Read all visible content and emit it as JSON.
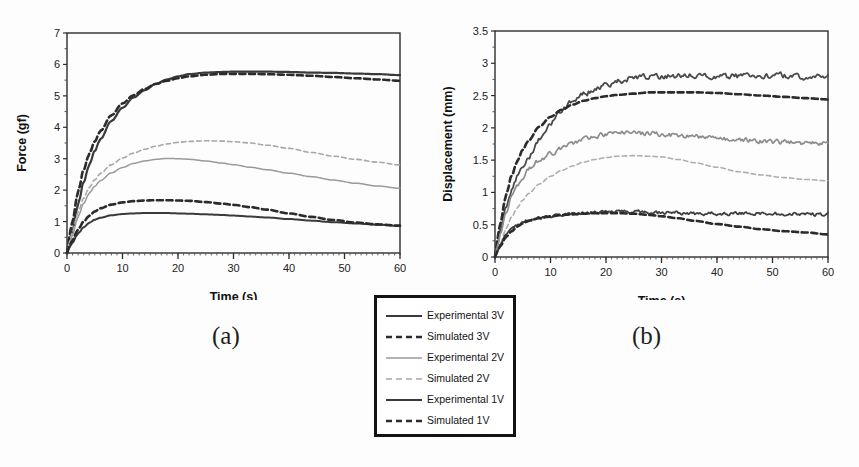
{
  "figure": {
    "panel_a_caption": "(a)",
    "panel_b_caption": "(b)"
  },
  "legend": {
    "items": [
      {
        "label": "Experimental 3V",
        "style": "solid",
        "color": "#3a3a3a",
        "width": 2.2
      },
      {
        "label": "Simulated 3V",
        "style": "dashed",
        "color": "#2b2b2b",
        "width": 2.6
      },
      {
        "label": "Experimental 2V",
        "style": "solid",
        "color": "#9a9a9a",
        "width": 1.5
      },
      {
        "label": "Simulated 2V",
        "style": "dashed",
        "color": "#a8a8a8",
        "width": 1.6
      },
      {
        "label": "Experimental 1V",
        "style": "solid",
        "color": "#3a3a3a",
        "width": 2.0
      },
      {
        "label": "Simulated 1V",
        "style": "dashed",
        "color": "#2b2b2b",
        "width": 2.6
      }
    ]
  },
  "chart_data": [
    {
      "id": "panel-a",
      "type": "line",
      "title": "",
      "xlabel": "Time (s)",
      "ylabel": "Force (gf)",
      "xlim": [
        0,
        60
      ],
      "ylim": [
        0,
        7
      ],
      "xticks": [
        0,
        10,
        20,
        30,
        40,
        50,
        60
      ],
      "yticks": [
        0,
        1,
        2,
        3,
        4,
        5,
        6,
        7
      ],
      "xticklabels": [
        "0",
        "10",
        "20",
        "30",
        "40",
        "50",
        "60"
      ],
      "yticklabels": [
        "0",
        "1",
        "2",
        "3",
        "4",
        "5",
        "6",
        "7"
      ],
      "x_minor_tick_step": 1,
      "grid": false,
      "legend_position": "external-below-center",
      "series": [
        {
          "name": "Experimental 3V",
          "style": "solid",
          "color": "#3a3a3a",
          "width": 2.2,
          "x": [
            0,
            0.5,
            1,
            2,
            3,
            4,
            5,
            6,
            8,
            10,
            12,
            14,
            16,
            18,
            20,
            22,
            25,
            28,
            30,
            33,
            36,
            40,
            44,
            48,
            52,
            56,
            60
          ],
          "y": [
            0,
            0.35,
            0.75,
            1.55,
            2.25,
            2.8,
            3.25,
            3.62,
            4.2,
            4.62,
            4.95,
            5.18,
            5.38,
            5.52,
            5.62,
            5.69,
            5.74,
            5.76,
            5.77,
            5.77,
            5.77,
            5.76,
            5.74,
            5.73,
            5.71,
            5.69,
            5.66
          ]
        },
        {
          "name": "Simulated 3V",
          "style": "dashed",
          "color": "#2b2b2b",
          "width": 2.6,
          "x": [
            0,
            0.5,
            1,
            2,
            3,
            4,
            5,
            6,
            8,
            10,
            12,
            14,
            16,
            18,
            20,
            22,
            25,
            28,
            30,
            33,
            36,
            40,
            44,
            48,
            52,
            56,
            60
          ],
          "y": [
            0,
            0.55,
            1.05,
            1.95,
            2.65,
            3.15,
            3.55,
            3.88,
            4.38,
            4.76,
            5.02,
            5.22,
            5.38,
            5.48,
            5.56,
            5.62,
            5.67,
            5.7,
            5.7,
            5.7,
            5.69,
            5.67,
            5.64,
            5.6,
            5.56,
            5.52,
            5.48
          ]
        },
        {
          "name": "Experimental 2V",
          "style": "solid",
          "color": "#9a9a9a",
          "width": 1.5,
          "x": [
            0,
            0.5,
            1,
            2,
            3,
            4,
            5,
            6,
            8,
            10,
            12,
            14,
            16,
            18,
            20,
            22,
            25,
            28,
            30,
            33,
            36,
            40,
            44,
            48,
            52,
            56,
            60
          ],
          "y": [
            0,
            0.3,
            0.6,
            1.15,
            1.58,
            1.9,
            2.12,
            2.3,
            2.55,
            2.72,
            2.85,
            2.93,
            2.98,
            3.01,
            3.0,
            2.98,
            2.93,
            2.86,
            2.81,
            2.73,
            2.65,
            2.54,
            2.43,
            2.32,
            2.22,
            2.13,
            2.06
          ]
        },
        {
          "name": "Simulated 2V",
          "style": "dashed",
          "color": "#a8a8a8",
          "width": 1.6,
          "x": [
            0,
            0.5,
            1,
            2,
            3,
            4,
            5,
            6,
            8,
            10,
            12,
            14,
            16,
            18,
            20,
            22,
            25,
            28,
            30,
            33,
            36,
            40,
            44,
            48,
            52,
            56,
            60
          ],
          "y": [
            0,
            0.35,
            0.7,
            1.3,
            1.75,
            2.08,
            2.33,
            2.53,
            2.81,
            3.02,
            3.18,
            3.3,
            3.4,
            3.47,
            3.52,
            3.55,
            3.57,
            3.56,
            3.54,
            3.5,
            3.43,
            3.33,
            3.2,
            3.08,
            2.98,
            2.89,
            2.8
          ]
        },
        {
          "name": "Experimental 1V",
          "style": "solid",
          "color": "#3a3a3a",
          "width": 2.0,
          "x": [
            0,
            0.5,
            1,
            2,
            3,
            4,
            5,
            6,
            8,
            10,
            12,
            14,
            16,
            18,
            20,
            22,
            25,
            28,
            30,
            33,
            36,
            40,
            44,
            48,
            52,
            56,
            60
          ],
          "y": [
            0,
            0.18,
            0.34,
            0.62,
            0.82,
            0.96,
            1.06,
            1.12,
            1.2,
            1.24,
            1.26,
            1.27,
            1.27,
            1.27,
            1.26,
            1.25,
            1.23,
            1.21,
            1.19,
            1.16,
            1.13,
            1.08,
            1.03,
            0.98,
            0.94,
            0.9,
            0.86
          ]
        },
        {
          "name": "Simulated 1V",
          "style": "dashed",
          "color": "#2b2b2b",
          "width": 2.6,
          "x": [
            0,
            0.5,
            1,
            2,
            3,
            4,
            5,
            6,
            8,
            10,
            12,
            14,
            16,
            18,
            20,
            22,
            25,
            28,
            30,
            33,
            36,
            40,
            44,
            48,
            52,
            56,
            60
          ],
          "y": [
            0,
            0.22,
            0.42,
            0.75,
            1.0,
            1.18,
            1.32,
            1.42,
            1.54,
            1.61,
            1.65,
            1.67,
            1.68,
            1.68,
            1.67,
            1.66,
            1.62,
            1.57,
            1.53,
            1.46,
            1.38,
            1.26,
            1.15,
            1.05,
            0.97,
            0.91,
            0.87
          ]
        }
      ]
    },
    {
      "id": "panel-b",
      "type": "line",
      "title": "",
      "xlabel": "Time (s)",
      "ylabel": "Displacement (mm)",
      "xlim": [
        0,
        60
      ],
      "ylim": [
        0,
        3.5
      ],
      "xticks": [
        0,
        10,
        20,
        30,
        40,
        50,
        60
      ],
      "yticks": [
        0,
        0.5,
        1,
        1.5,
        2,
        2.5,
        3,
        3.5
      ],
      "xticklabels": [
        "0",
        "10",
        "20",
        "30",
        "40",
        "50",
        "60"
      ],
      "yticklabels": [
        "0",
        "0.5",
        "1",
        "1.5",
        "2",
        "2.5",
        "3",
        "3.5"
      ],
      "x_minor_tick_step": 1,
      "grid": false,
      "legend_position": "external-below-center",
      "series": [
        {
          "name": "Experimental 3V",
          "style": "solid",
          "color": "#4a4a4a",
          "width": 1.8,
          "noise": 0.035,
          "x": [
            0,
            0.5,
            1,
            2,
            3,
            4,
            5,
            6,
            8,
            10,
            12,
            14,
            16,
            18,
            20,
            22,
            25,
            28,
            30,
            33,
            36,
            40,
            44,
            48,
            52,
            56,
            60
          ],
          "y": [
            0,
            0.2,
            0.42,
            0.78,
            1.02,
            1.22,
            1.4,
            1.56,
            1.82,
            2.08,
            2.28,
            2.42,
            2.52,
            2.6,
            2.66,
            2.72,
            2.77,
            2.79,
            2.79,
            2.81,
            2.82,
            2.8,
            2.8,
            2.81,
            2.81,
            2.79,
            2.79
          ]
        },
        {
          "name": "Simulated 3V",
          "style": "dashed",
          "color": "#2b2b2b",
          "width": 2.6,
          "x": [
            0,
            0.5,
            1,
            2,
            3,
            4,
            5,
            6,
            8,
            10,
            12,
            14,
            16,
            18,
            20,
            22,
            25,
            28,
            30,
            33,
            36,
            40,
            44,
            48,
            52,
            56,
            60
          ],
          "y": [
            0,
            0.28,
            0.55,
            0.96,
            1.26,
            1.48,
            1.66,
            1.8,
            2.02,
            2.17,
            2.28,
            2.36,
            2.42,
            2.46,
            2.49,
            2.51,
            2.53,
            2.55,
            2.55,
            2.55,
            2.55,
            2.54,
            2.52,
            2.5,
            2.48,
            2.46,
            2.44
          ]
        },
        {
          "name": "Experimental 2V",
          "style": "solid",
          "color": "#8d8d8d",
          "width": 1.7,
          "noise": 0.03,
          "x": [
            0,
            0.5,
            1,
            2,
            3,
            4,
            5,
            6,
            8,
            10,
            12,
            14,
            16,
            18,
            20,
            22,
            25,
            28,
            30,
            33,
            36,
            40,
            44,
            48,
            52,
            56,
            60
          ],
          "y": [
            0,
            0.18,
            0.38,
            0.68,
            0.92,
            1.1,
            1.25,
            1.36,
            1.5,
            1.6,
            1.68,
            1.76,
            1.84,
            1.88,
            1.9,
            1.92,
            1.92,
            1.92,
            1.9,
            1.88,
            1.86,
            1.84,
            1.82,
            1.8,
            1.78,
            1.77,
            1.76
          ]
        },
        {
          "name": "Simulated 2V",
          "style": "dashed",
          "color": "#aeaeae",
          "width": 1.6,
          "x": [
            0,
            0.5,
            1,
            2,
            3,
            4,
            5,
            6,
            8,
            10,
            12,
            14,
            16,
            18,
            20,
            22,
            25,
            28,
            30,
            33,
            36,
            40,
            44,
            48,
            52,
            56,
            60
          ],
          "y": [
            0,
            0.1,
            0.22,
            0.44,
            0.62,
            0.76,
            0.88,
            0.98,
            1.13,
            1.25,
            1.34,
            1.41,
            1.47,
            1.51,
            1.54,
            1.56,
            1.57,
            1.56,
            1.55,
            1.51,
            1.46,
            1.39,
            1.32,
            1.27,
            1.23,
            1.2,
            1.18
          ]
        },
        {
          "name": "Experimental 1V",
          "style": "solid",
          "color": "#3f3f3f",
          "width": 1.8,
          "noise": 0.022,
          "x": [
            0,
            0.5,
            1,
            2,
            3,
            4,
            5,
            6,
            8,
            10,
            12,
            14,
            16,
            18,
            20,
            22,
            25,
            28,
            30,
            33,
            36,
            40,
            44,
            48,
            52,
            56,
            60
          ],
          "y": [
            0,
            0.1,
            0.2,
            0.34,
            0.43,
            0.49,
            0.53,
            0.56,
            0.6,
            0.63,
            0.65,
            0.66,
            0.68,
            0.7,
            0.7,
            0.7,
            0.7,
            0.69,
            0.68,
            0.68,
            0.67,
            0.67,
            0.67,
            0.67,
            0.67,
            0.66,
            0.66
          ]
        },
        {
          "name": "Simulated 1V",
          "style": "dashed",
          "color": "#2b2b2b",
          "width": 2.6,
          "x": [
            0,
            0.5,
            1,
            2,
            3,
            4,
            5,
            6,
            8,
            10,
            12,
            14,
            16,
            18,
            20,
            22,
            25,
            28,
            30,
            33,
            36,
            40,
            44,
            48,
            52,
            56,
            60
          ],
          "y": [
            0,
            0.09,
            0.18,
            0.31,
            0.4,
            0.47,
            0.52,
            0.56,
            0.6,
            0.63,
            0.65,
            0.66,
            0.67,
            0.68,
            0.68,
            0.68,
            0.67,
            0.65,
            0.63,
            0.6,
            0.56,
            0.51,
            0.47,
            0.43,
            0.4,
            0.38,
            0.35
          ]
        }
      ]
    }
  ]
}
